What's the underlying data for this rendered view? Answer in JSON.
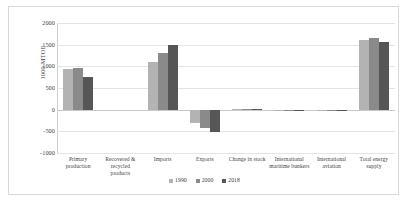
{
  "chart_data": {
    "type": "bar",
    "title": "",
    "xlabel": "",
    "ylabel": "1000 MTOE",
    "ylim": [
      -1000,
      2000
    ],
    "ytick_step": 500,
    "yticks": [
      2000,
      1500,
      1000,
      500,
      0,
      -500,
      -1000
    ],
    "grid": true,
    "legend_position": "bottom",
    "categories": [
      "Primary production",
      "Recovered & recycled products",
      "Imports",
      "Exports",
      "Change in stock",
      "International maritime bunkers",
      "International aviation",
      "Total energy supply"
    ],
    "series": [
      {
        "name": "1990",
        "color": "#b3b3b3",
        "values": [
          950,
          0,
          1100,
          -300,
          5,
          -20,
          -10,
          1600
        ]
      },
      {
        "name": "2000",
        "color": "#8a8a8a",
        "values": [
          960,
          0,
          1300,
          -420,
          5,
          -25,
          -15,
          1650
        ]
      },
      {
        "name": "2018",
        "color": "#565656",
        "values": [
          750,
          0,
          1500,
          -520,
          5,
          -40,
          -30,
          1570
        ]
      }
    ]
  },
  "legend": {
    "items": [
      {
        "label": "1990"
      },
      {
        "label": "2000"
      },
      {
        "label": "2018"
      }
    ]
  },
  "axis": {
    "y_title": "1000 MTOE",
    "tick_labels": [
      "2000",
      "1500",
      "1000",
      "500",
      "0",
      "-500",
      "-1000"
    ]
  }
}
